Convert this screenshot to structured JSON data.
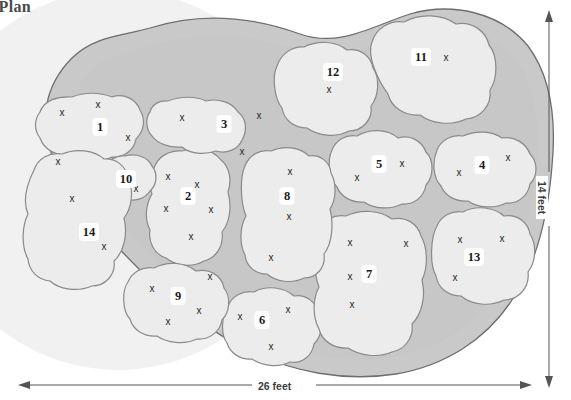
{
  "title": "g Plan",
  "dimensions": {
    "width_label": "26 feet",
    "height_label": "14 feet"
  },
  "colors": {
    "page_background": "#ffffff",
    "shadow_circle": "#f0f0f0",
    "border_band": "#c9c9c9",
    "bed_fill": "#ececec",
    "bed_stroke": "#8a8a8a",
    "outline_stroke": "#6e6e6e",
    "badge_fill": "#ffffff",
    "number_text": "#1a1a1a",
    "marker_text": "#262626",
    "title_text": "#4a4a4a",
    "dimension_text": "#3d3d3d"
  },
  "chart_data": {
    "type": "diagram",
    "title": "g Plan",
    "subtype": "garden-planting-plan",
    "plot_width_feet": 26,
    "plot_height_feet": 14,
    "bed_count": 14,
    "marker_glyph": "x",
    "beds": [
      {
        "id": 1,
        "label": "1",
        "label_x": 100,
        "label_y": 127,
        "outline": "M 40,112 C 44,100 58,96 72,97 C 84,92 100,92 112,97 C 124,93 136,99 140,110 C 146,120 144,131 136,139 C 134,150 124,158 112,157 C 100,163 84,162 72,156 C 58,157 44,150 40,138 C 34,130 34,120 40,112 Z",
        "markers": [
          [
            62,
            113
          ],
          [
            98,
            105
          ],
          [
            128,
            138
          ]
        ]
      },
      {
        "id": 2,
        "label": "2",
        "label_x": 188,
        "label_y": 196,
        "outline": "M 154,168 C 158,156 170,150 182,151 C 196,146 212,149 220,159 C 230,167 232,180 228,192 C 232,206 230,222 222,232 C 224,246 216,258 204,261 C 192,268 176,266 166,258 C 154,254 148,242 150,230 C 144,218 146,204 152,194 C 148,184 149,174 154,168 Z",
        "markers": [
          [
            168,
            177
          ],
          [
            197,
            185
          ],
          [
            166,
            209
          ],
          [
            211,
            210
          ],
          [
            191,
            237
          ]
        ]
      },
      {
        "id": 3,
        "label": "3",
        "label_x": 224,
        "label_y": 124,
        "outline": "M 150,112 C 152,104 160,100 168,101 C 180,96 196,96 206,101 C 218,98 232,102 238,112 C 246,118 248,130 242,140 C 238,150 226,154 216,151 C 204,155 190,154 182,147 C 170,148 158,144 152,136 C 146,130 145,118 150,112 Z",
        "markers": [
          [
            182,
            118
          ],
          [
            259,
            116
          ],
          [
            242,
            152
          ]
        ]
      },
      {
        "id": 4,
        "label": "4",
        "label_x": 482,
        "label_y": 165,
        "outline": "M 437,150 C 441,140 452,134 463,136 C 476,130 492,131 502,138 C 514,136 526,143 530,154 C 538,162 538,176 530,184 C 528,196 518,204 506,203 C 494,209 478,208 468,201 C 456,202 445,196 441,186 C 433,178 432,162 437,150 Z",
        "markers": [
          [
            459,
            173
          ],
          [
            508,
            158
          ]
        ]
      },
      {
        "id": 5,
        "label": "5",
        "label_x": 379,
        "label_y": 164,
        "outline": "M 332,150 C 336,140 346,134 357,136 C 370,128 388,129 398,138 C 410,134 422,141 426,152 C 434,160 434,176 426,185 C 424,197 414,205 402,204 C 390,210 374,209 364,202 C 352,203 341,197 337,187 C 329,179 327,160 332,150 Z",
        "markers": [
          [
            357,
            178
          ],
          [
            402,
            164
          ]
        ]
      },
      {
        "id": 6,
        "label": "6",
        "label_x": 262,
        "label_y": 320,
        "outline": "M 228,306 C 232,296 243,290 254,292 C 267,285 284,287 294,296 C 306,294 316,302 318,313 C 324,322 322,336 314,344 C 312,356 302,364 290,362 C 278,368 262,366 252,359 C 240,360 230,353 227,343 C 220,334 222,314 228,306 Z",
        "markers": [
          [
            240,
            317
          ],
          [
            288,
            310
          ],
          [
            271,
            347
          ]
        ]
      },
      {
        "id": 7,
        "label": "7",
        "label_x": 369,
        "label_y": 274,
        "outline": "M 318,232 C 322,220 334,214 346,216 C 360,209 380,210 392,219 C 406,216 418,224 421,236 C 428,248 428,268 422,280 C 426,296 422,314 412,324 C 414,338 404,350 392,352 C 378,358 360,356 348,348 C 334,349 322,341 319,329 C 312,316 313,298 319,287 C 313,272 313,244 318,232 Z",
        "markers": [
          [
            350,
            243
          ],
          [
            406,
            244
          ],
          [
            350,
            277
          ],
          [
            352,
            305
          ]
        ]
      },
      {
        "id": 8,
        "label": "8",
        "label_x": 287,
        "label_y": 196,
        "outline": "M 245,166 C 249,155 260,149 271,151 C 284,145 300,147 309,156 C 320,154 330,162 331,173 C 337,184 336,200 330,209 C 334,224 332,244 324,254 C 326,268 316,278 304,278 C 292,284 276,282 267,274 C 255,274 246,266 245,255 C 239,244 240,226 246,216 C 240,202 240,176 245,166 Z",
        "markers": [
          [
            290,
            172
          ],
          [
            289,
            217
          ],
          [
            271,
            258
          ]
        ]
      },
      {
        "id": 9,
        "label": "9",
        "label_x": 178,
        "label_y": 296,
        "outline": "M 128,282 C 132,272 143,266 154,268 C 167,261 185,262 196,271 C 210,268 222,276 224,288 C 231,297 230,312 222,320 C 220,332 209,340 197,339 C 184,345 167,343 157,336 C 144,337 133,330 130,319 C 122,311 122,290 128,282 Z",
        "markers": [
          [
            152,
            289
          ],
          [
            210,
            277
          ],
          [
            199,
            311
          ],
          [
            168,
            322
          ]
        ]
      },
      {
        "id": 10,
        "label": "10",
        "label_x": 126,
        "label_y": 179,
        "outline": "M 106,168 C 108,160 116,155 125,156 C 136,153 148,157 152,166 C 158,173 157,185 150,191 C 145,199 134,202 125,199 C 115,199 107,193 105,184 C 102,177 103,172 106,168 Z",
        "markers": [
          [
            136,
            189
          ]
        ]
      },
      {
        "id": 11,
        "label": "11",
        "label_x": 421,
        "label_y": 57,
        "outline": "M 372,42 C 376,28 390,20 404,22 C 420,13 442,14 456,24 C 472,21 486,31 489,45 C 498,56 498,78 490,90 C 492,106 480,118 466,119 C 452,126 432,124 420,115 C 404,116 391,107 388,94 C 379,82 366,56 372,42 Z",
        "markers": [
          [
            446,
            58
          ]
        ]
      },
      {
        "id": 12,
        "label": "12",
        "label_x": 333,
        "label_y": 72,
        "outline": "M 277,66 C 281,54 292,46 304,47 C 318,40 336,41 347,50 C 360,48 371,56 373,68 C 380,78 379,96 371,106 C 373,120 362,131 349,131 C 336,138 318,136 307,128 C 294,128 284,120 282,108 C 274,98 272,76 277,66 Z",
        "markers": [
          [
            329,
            90
          ]
        ]
      },
      {
        "id": 13,
        "label": "13",
        "label_x": 474,
        "label_y": 257,
        "outline": "M 437,226 C 441,216 452,210 463,212 C 476,205 494,207 504,216 C 517,214 528,222 530,234 C 537,245 536,262 528,272 C 530,288 518,300 504,300 C 490,307 472,305 461,296 C 448,296 438,288 436,276 C 429,264 431,236 437,226 Z",
        "markers": [
          [
            460,
            240
          ],
          [
            502,
            239
          ],
          [
            455,
            278
          ]
        ]
      },
      {
        "id": 14,
        "label": "14",
        "label_x": 89,
        "label_y": 232,
        "outline": "M 34,170 C 38,158 50,152 62,154 C 76,148 94,150 104,159 C 116,158 126,166 128,178 C 134,190 132,208 124,218 C 128,234 124,252 114,261 C 116,275 105,286 92,286 C 78,292 60,290 50,281 C 38,280 29,271 28,259 C 21,246 22,226 28,214 C 22,200 28,182 34,170 Z",
        "markers": [
          [
            58,
            162
          ],
          [
            72,
            199
          ],
          [
            104,
            247
          ]
        ]
      }
    ]
  }
}
